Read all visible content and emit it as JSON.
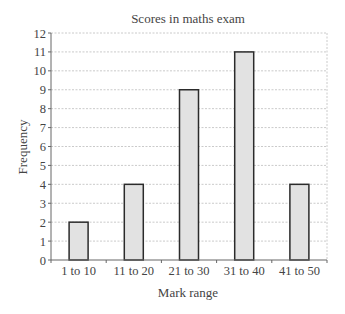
{
  "chart_data": {
    "type": "bar",
    "title": "Scores in maths exam",
    "xlabel": "Mark range",
    "ylabel": "Frequency",
    "categories": [
      "1 to 10",
      "11 to 20",
      "21 to 30",
      "31 to 40",
      "41 to 50"
    ],
    "values": [
      2,
      4,
      9,
      11,
      4
    ],
    "ylim": [
      0,
      12
    ],
    "yticks": [
      0,
      1,
      2,
      3,
      4,
      5,
      6,
      7,
      8,
      9,
      10,
      11,
      12
    ],
    "grid": true,
    "legend": null,
    "colors": {
      "bar_fill": "#e2e2e2",
      "bar_stroke": "#2b2b2b",
      "grid": "#bdbdbd",
      "axis": "#666666"
    }
  }
}
